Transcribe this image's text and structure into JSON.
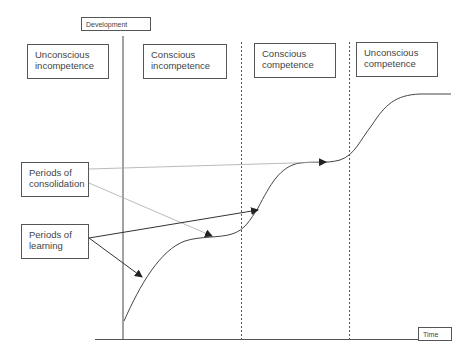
{
  "axes": {
    "y_label": "Development",
    "x_label": "Time"
  },
  "stages": [
    {
      "line1": "Unconscious",
      "line2": "incompetence"
    },
    {
      "line1": "Conscious",
      "line2": "incompetence"
    },
    {
      "line1": "Conscious",
      "line2": "competence"
    },
    {
      "line1": "Unconscious",
      "line2": "competence"
    }
  ],
  "annotations": {
    "consolidation": {
      "line1": "Periods of",
      "line2": "consolidation"
    },
    "learning": {
      "line1": "Periods of",
      "line2": "learning"
    }
  },
  "colors": {
    "line": "#444444",
    "light_arrow": "#999999",
    "box_border": "#555555"
  }
}
